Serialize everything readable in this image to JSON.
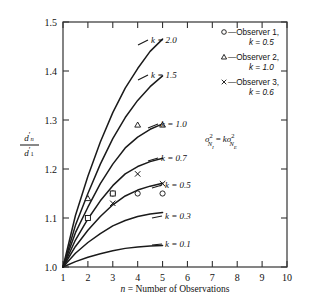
{
  "chart_data": {
    "type": "line",
    "title": "",
    "xlabel": "n = Number of Observations",
    "ylabel": "d'n / d'1",
    "ylabel_num": "d'n",
    "ylabel_den": "d'1",
    "xlim": [
      1,
      10
    ],
    "ylim": [
      1.0,
      1.5
    ],
    "xticks": [
      1,
      2,
      3,
      4,
      5,
      6,
      7,
      8,
      9,
      10
    ],
    "yticks": [
      1.0,
      1.1,
      1.2,
      1.3,
      1.4,
      1.5
    ],
    "ytick_labels": [
      "1.0",
      "1.1",
      "1.2",
      "1.3",
      "1.4",
      "1.5"
    ],
    "xtick_labels": [
      "1",
      "2",
      "3",
      "4",
      "5",
      "6",
      "7",
      "8",
      "9",
      "10"
    ],
    "grid": false,
    "legend_position": "top-right",
    "annotation": "σ²(N_I) = k σ²(N_E)",
    "series": [
      {
        "name": "k = 2.0",
        "k": 2.0,
        "label": "k = 2.0",
        "x": [
          1,
          1.5,
          2,
          2.5,
          3,
          3.5,
          4,
          4.5,
          5
        ],
        "values": [
          1.0,
          1.105,
          1.185,
          1.255,
          1.315,
          1.365,
          1.405,
          1.44,
          1.465
        ]
      },
      {
        "name": "k = 1.5",
        "k": 1.5,
        "label": "k = 1.5",
        "x": [
          1,
          1.5,
          2,
          2.5,
          3,
          3.5,
          4,
          4.5,
          5
        ],
        "values": [
          1.0,
          1.085,
          1.15,
          1.21,
          1.262,
          1.305,
          1.34,
          1.368,
          1.39
        ]
      },
      {
        "name": "k = 1.0",
        "k": 1.0,
        "label": "k = 1.0",
        "x": [
          1,
          1.5,
          2,
          2.5,
          3,
          3.5,
          4,
          4.5,
          5
        ],
        "values": [
          1.0,
          1.07,
          1.122,
          1.17,
          1.21,
          1.243,
          1.265,
          1.281,
          1.292
        ]
      },
      {
        "name": "k = 0.7",
        "k": 0.7,
        "label": "k = 0.7",
        "x": [
          1,
          1.5,
          2,
          2.5,
          3,
          3.5,
          4,
          4.5,
          5
        ],
        "values": [
          1.0,
          1.055,
          1.098,
          1.135,
          1.166,
          1.19,
          1.205,
          1.215,
          1.222
        ]
      },
      {
        "name": "k = 0.5",
        "k": 0.5,
        "label": "k = 0.5",
        "x": [
          1,
          1.5,
          2,
          2.5,
          3,
          3.5,
          4,
          4.5,
          5
        ],
        "values": [
          1.0,
          1.042,
          1.075,
          1.103,
          1.127,
          1.145,
          1.157,
          1.165,
          1.171
        ]
      },
      {
        "name": "k = 0.3",
        "k": 0.3,
        "label": "k = 0.3",
        "x": [
          1,
          1.5,
          2,
          2.5,
          3,
          3.5,
          4,
          4.5,
          5
        ],
        "values": [
          1.0,
          1.028,
          1.05,
          1.068,
          1.084,
          1.095,
          1.103,
          1.108,
          1.111
        ]
      },
      {
        "name": "k = 0.1",
        "k": 0.1,
        "label": "k = 0.1",
        "x": [
          1,
          1.5,
          2,
          2.5,
          3,
          3.5,
          4,
          4.5,
          5
        ],
        "values": [
          1.0,
          1.011,
          1.02,
          1.027,
          1.033,
          1.038,
          1.041,
          1.043,
          1.044
        ]
      }
    ],
    "observers": [
      {
        "name": "Observer 1",
        "marker": "circle",
        "k": 0.5,
        "x": [
          2,
          3,
          4,
          5
        ],
        "values": [
          1.1,
          1.15,
          1.15,
          1.15
        ]
      },
      {
        "name": "Observer 2",
        "marker": "triangle",
        "k": 1.0,
        "x": [
          2,
          4,
          5
        ],
        "values": [
          1.14,
          1.29,
          1.29
        ]
      },
      {
        "name": "Observer 3",
        "marker": "cross",
        "k": 0.6,
        "x": [
          3,
          4,
          5
        ],
        "values": [
          1.13,
          1.19,
          1.17
        ]
      },
      {
        "name": "extra-square",
        "marker": "square",
        "k": 0.5,
        "x": [
          2,
          3
        ],
        "values": [
          1.1,
          1.15
        ]
      }
    ]
  },
  "legend": {
    "entries": [
      {
        "marker": "circle",
        "line1": "—Observer 1,",
        "line2": "k = 0.5"
      },
      {
        "marker": "triangle",
        "line1": "—Observer 2,",
        "line2": "k = 1.0"
      },
      {
        "marker": "cross",
        "line1": "—Observer 3,",
        "line2": "k = 0.6"
      }
    ]
  },
  "formula": {
    "sigma": "σ",
    "sup": "2",
    "sub_left": "N",
    "sub_left_sub": "I",
    "equals": "=",
    "k": "k",
    "sub_right": "N",
    "sub_right_sub": "E"
  },
  "curve_labels": {
    "k20": "k = 2.0",
    "k15": "k = 1.5",
    "k10": "k = 1.0",
    "k07": "k = 0.7",
    "k05": "k = 0.5",
    "k03": "k = 0.3",
    "k01": "k = 0.1"
  },
  "axis": {
    "x_title_italic": "n",
    "x_title_rest": " = Number of Observations",
    "y_num_d": "d",
    "y_num_prime": "′",
    "y_num_sub": "n",
    "y_den_d": "d",
    "y_den_prime": "′",
    "y_den_sub": "1"
  },
  "colors": {
    "background": "#ffffff",
    "ink": "#111111",
    "curve": "#1a1a1a",
    "frame": "#333333"
  }
}
